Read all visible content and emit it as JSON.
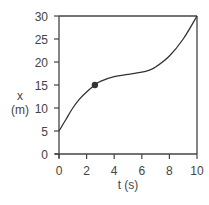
{
  "chart_data": {
    "type": "line",
    "title": "",
    "xlabel": "t (s)",
    "ylabel_line1": "x",
    "ylabel_line2": "(m)",
    "xlim": [
      0,
      10
    ],
    "ylim": [
      0,
      30
    ],
    "x_ticks": [
      0,
      2,
      4,
      6,
      8,
      10
    ],
    "y_ticks": [
      0,
      5,
      10,
      15,
      20,
      25,
      30
    ],
    "grid": false,
    "legend": null,
    "series": [
      {
        "name": "position",
        "x": [
          0,
          0.5,
          1,
          1.5,
          2,
          2.6,
          3,
          4,
          5,
          6,
          6.5,
          7,
          8,
          9,
          10
        ],
        "values": [
          5,
          7.5,
          10,
          12,
          13.5,
          15,
          15.8,
          16.8,
          17.3,
          17.8,
          18.2,
          18.9,
          21.3,
          25,
          30
        ]
      }
    ],
    "marked_point": {
      "t": 2.6,
      "x": 15
    }
  }
}
